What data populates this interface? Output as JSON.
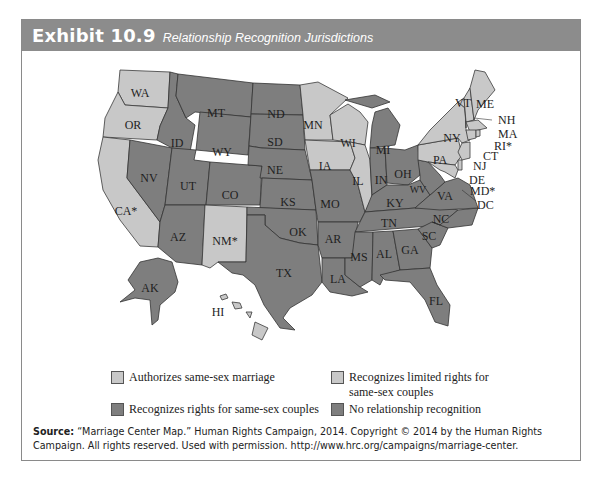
{
  "header": {
    "exhibit_number": "Exhibit 10.9",
    "title": "Relationship Recognition Jurisdictions"
  },
  "colors": {
    "header_bg": "#8c8c8c",
    "authorizes_marriage": "#c8c8c8",
    "limited_rights": "#c8c8c8",
    "recognizes_rights": "#7e7e7e",
    "no_recognition": "#7e7e7e"
  },
  "map": {
    "states": {
      "WA": {
        "label": "WA",
        "category": "authorizes_marriage"
      },
      "OR": {
        "label": "OR",
        "category": "authorizes_marriage"
      },
      "CA": {
        "label": "CA*",
        "category": "authorizes_marriage"
      },
      "NV": {
        "label": "NV",
        "category": "no_recognition"
      },
      "ID": {
        "label": "ID",
        "category": "no_recognition"
      },
      "MT": {
        "label": "MT",
        "category": "no_recognition"
      },
      "WY": {
        "label": "WY",
        "category": "no_recognition"
      },
      "UT": {
        "label": "UT",
        "category": "no_recognition"
      },
      "CO": {
        "label": "CO",
        "category": "no_recognition"
      },
      "AZ": {
        "label": "AZ",
        "category": "no_recognition"
      },
      "NM": {
        "label": "NM*",
        "category": "authorizes_marriage"
      },
      "ND": {
        "label": "ND",
        "category": "no_recognition"
      },
      "SD": {
        "label": "SD",
        "category": "no_recognition"
      },
      "NE": {
        "label": "NE",
        "category": "no_recognition"
      },
      "KS": {
        "label": "KS",
        "category": "no_recognition"
      },
      "OK": {
        "label": "OK",
        "category": "no_recognition"
      },
      "TX": {
        "label": "TX",
        "category": "no_recognition"
      },
      "MN": {
        "label": "MN",
        "category": "authorizes_marriage"
      },
      "IA": {
        "label": "IA",
        "category": "authorizes_marriage"
      },
      "MO": {
        "label": "MO",
        "category": "no_recognition"
      },
      "AR": {
        "label": "AR",
        "category": "no_recognition"
      },
      "LA": {
        "label": "LA",
        "category": "no_recognition"
      },
      "WI": {
        "label": "WI",
        "category": "limited_rights"
      },
      "IL": {
        "label": "IL",
        "category": "authorizes_marriage"
      },
      "MI": {
        "label": "MI",
        "category": "no_recognition"
      },
      "IN": {
        "label": "IN",
        "category": "no_recognition"
      },
      "OH": {
        "label": "OH",
        "category": "no_recognition"
      },
      "KY": {
        "label": "KY",
        "category": "no_recognition"
      },
      "TN": {
        "label": "TN",
        "category": "no_recognition"
      },
      "MS": {
        "label": "MS",
        "category": "no_recognition"
      },
      "AL": {
        "label": "AL",
        "category": "no_recognition"
      },
      "GA": {
        "label": "GA",
        "category": "no_recognition"
      },
      "FL": {
        "label": "FL",
        "category": "no_recognition"
      },
      "SC": {
        "label": "SC",
        "category": "no_recognition"
      },
      "NC": {
        "label": "NC",
        "category": "no_recognition"
      },
      "VA": {
        "label": "VA",
        "category": "no_recognition"
      },
      "WV": {
        "label": "WV",
        "category": "no_recognition"
      },
      "PA": {
        "label": "PA",
        "category": "authorizes_marriage"
      },
      "NY": {
        "label": "NY",
        "category": "authorizes_marriage"
      },
      "VT": {
        "label": "VT",
        "category": "authorizes_marriage"
      },
      "ME": {
        "label": "ME",
        "category": "authorizes_marriage"
      },
      "NH": {
        "label": "NH",
        "category": "authorizes_marriage"
      },
      "MA": {
        "label": "MA",
        "category": "authorizes_marriage"
      },
      "RI": {
        "label": "RI*",
        "category": "authorizes_marriage"
      },
      "CT": {
        "label": "CT",
        "category": "authorizes_marriage"
      },
      "NJ": {
        "label": "NJ",
        "category": "authorizes_marriage"
      },
      "DE": {
        "label": "DE",
        "category": "authorizes_marriage"
      },
      "MD": {
        "label": "MD*",
        "category": "authorizes_marriage"
      },
      "DC": {
        "label": "DC",
        "category": "authorizes_marriage"
      },
      "AK": {
        "label": "AK",
        "category": "no_recognition"
      },
      "HI": {
        "label": "HI",
        "category": "authorizes_marriage"
      }
    }
  },
  "legend": {
    "items": [
      {
        "label": "Authorizes same-sex marriage",
        "key": "authorizes_marriage"
      },
      {
        "label": "Recognizes limited rights for",
        "label_line2": "same-sex couples",
        "key": "limited_rights"
      },
      {
        "label": "Recognizes rights for same-sex couples",
        "key": "recognizes_rights"
      },
      {
        "label": "No relationship recognition",
        "key": "no_recognition"
      }
    ]
  },
  "source": {
    "prefix": "Source:",
    "text": " “Marriage Center Map.” Human Rights Campaign, 2014. Copyright © 2014 by the Human Rights Campaign. All rights reserved. Used with permission. http://www.hrc.org/campaigns/marriage-center."
  }
}
